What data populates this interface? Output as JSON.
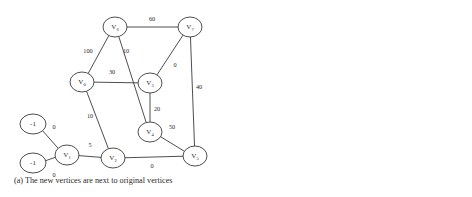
{
  "figure": {
    "panel_a": {
      "caption": "(a) The new vertices are next to original vertices",
      "type": "weighted-undirected-graph",
      "nodes": [
        {
          "id": "v6",
          "label": "V",
          "sub": "6",
          "cx": 115,
          "cy": 27,
          "rx": 12,
          "ry": 10
        },
        {
          "id": "v7",
          "label": "V",
          "sub": "7",
          "cx": 190,
          "cy": 27,
          "rx": 12,
          "ry": 10
        },
        {
          "id": "v0",
          "label": "V",
          "sub": "0",
          "cx": 82,
          "cy": 82,
          "rx": 12,
          "ry": 10
        },
        {
          "id": "v3",
          "label": "V",
          "sub": "3",
          "cx": 150,
          "cy": 83,
          "rx": 12,
          "ry": 10
        },
        {
          "id": "v4",
          "label": "V",
          "sub": "4",
          "cx": 150,
          "cy": 132,
          "rx": 12,
          "ry": 10
        },
        {
          "id": "v5",
          "label": "V",
          "sub": "5",
          "cx": 195,
          "cy": 156,
          "rx": 12,
          "ry": 10
        },
        {
          "id": "v2",
          "label": "V",
          "sub": "2",
          "cx": 113,
          "cy": 158,
          "rx": 12,
          "ry": 10
        },
        {
          "id": "v1",
          "label": "V",
          "sub": "1",
          "cx": 67,
          "cy": 155,
          "rx": 12,
          "ry": 10
        },
        {
          "id": "n1",
          "label": "-1",
          "sub": "",
          "cx": 33,
          "cy": 124,
          "rx": 13,
          "ry": 10
        },
        {
          "id": "n2",
          "label": "-1",
          "sub": "",
          "cx": 33,
          "cy": 163,
          "rx": 13,
          "ry": 10
        }
      ],
      "edges": [
        {
          "from": "v6",
          "to": "v7",
          "weight": "60",
          "lx": 152,
          "ly": 20
        },
        {
          "from": "v6",
          "to": "v0",
          "weight": "100",
          "lx": 88,
          "ly": 52
        },
        {
          "from": "v6",
          "to": "v4",
          "weight": "10",
          "lx": 126,
          "ly": 52
        },
        {
          "from": "v0",
          "to": "v3",
          "weight": "30",
          "lx": 112,
          "ly": 73
        },
        {
          "from": "v7",
          "to": "v3",
          "weight": "0",
          "lx": 175,
          "ly": 66
        },
        {
          "from": "v7",
          "to": "v5",
          "weight": "40",
          "lx": 199,
          "ly": 88
        },
        {
          "from": "v3",
          "to": "v4",
          "weight": "20",
          "lx": 157,
          "ly": 110
        },
        {
          "from": "v4",
          "to": "v5",
          "weight": "50",
          "lx": 172,
          "ly": 128
        },
        {
          "from": "v0",
          "to": "v2",
          "weight": "10",
          "lx": 90,
          "ly": 117
        },
        {
          "from": "v1",
          "to": "v2",
          "weight": "5",
          "lx": 90,
          "ly": 146
        },
        {
          "from": "v2",
          "to": "v5",
          "weight": "0",
          "lx": 152,
          "ly": 167
        },
        {
          "from": "n1",
          "to": "v1",
          "weight": "0",
          "lx": 54,
          "ly": 128
        },
        {
          "from": "n2",
          "to": "v1",
          "weight": "0",
          "lx": 54,
          "ly": 176
        }
      ]
    },
    "panel_b": {
      "caption": "(b) The assist array",
      "cells": [
        "0",
        "1",
        "2",
        "2",
        "3",
        "4",
        "5",
        "5"
      ]
    }
  },
  "colors": {
    "stroke": "#3a3a3a",
    "text": "#2b2b2b",
    "background": "#ffffff"
  }
}
